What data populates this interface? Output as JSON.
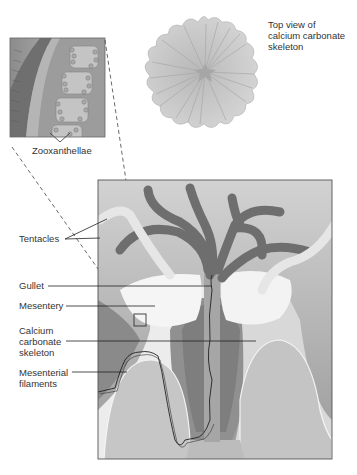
{
  "diagram": {
    "inset": {
      "label": "Zooxanthellae"
    },
    "top_view": {
      "label_line1": "Top view of",
      "label_line2": "calcium carbonate",
      "label_line3": "skeleton"
    },
    "labels": {
      "tentacles": "Tentacles",
      "gullet": "Gullet",
      "mesentery": "Mesentery",
      "calcium_line1": "Calcium",
      "calcium_line2": "carbonate",
      "calcium_line3": "skeleton",
      "filaments_line1": "Mesenterial",
      "filaments_line2": "filaments"
    },
    "colors": {
      "tentacle": "#6e6e6e",
      "panel_bg": "#bdbdbd",
      "body_light": "#eeeeee",
      "skeleton": "#c6c6c6",
      "dark_body": "#8a8a8a",
      "top_view_fill": "#cfcfcf",
      "label_text": "#333333"
    }
  }
}
